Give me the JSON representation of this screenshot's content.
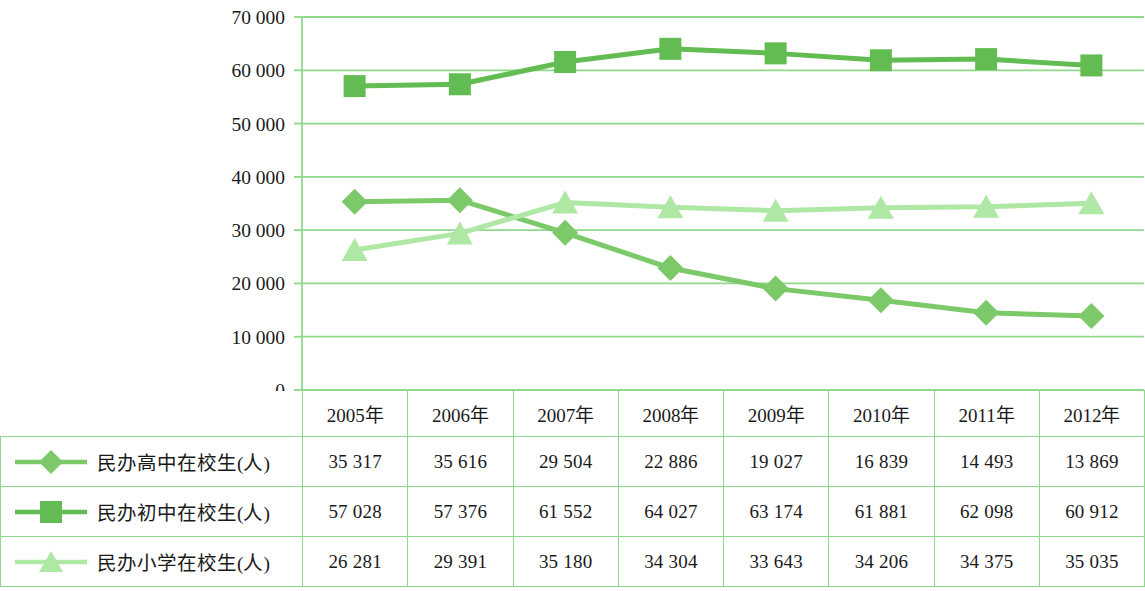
{
  "chart_data": {
    "type": "line",
    "title": "",
    "xlabel": "",
    "ylabel": "",
    "categories": [
      "2005年",
      "2006年",
      "2007年",
      "2008年",
      "2009年",
      "2010年",
      "2011年",
      "2012年"
    ],
    "ylim": [
      0,
      70000
    ],
    "yticks": [
      0,
      10000,
      20000,
      30000,
      40000,
      50000,
      60000,
      70000
    ],
    "ytick_labels": [
      "0",
      "10 000",
      "20 000",
      "30 000",
      "40 000",
      "50 000",
      "60 000",
      "70 000"
    ],
    "grid": true,
    "legend_position": "table-left",
    "series": [
      {
        "name": "民办高中在校生(人)",
        "marker": "diamond",
        "color": "#7cc96a",
        "values": [
          35317,
          35616,
          29504,
          22886,
          19027,
          16839,
          14493,
          13869
        ],
        "labels": [
          "35 317",
          "35 616",
          "29 504",
          "22 886",
          "19 027",
          "16 839",
          "14 493",
          "13 869"
        ]
      },
      {
        "name": "民办初中在校生(人)",
        "marker": "square",
        "color": "#63bc52",
        "values": [
          57028,
          57376,
          61552,
          64027,
          63174,
          61881,
          62098,
          60912
        ],
        "labels": [
          "57 028",
          "57 376",
          "61 552",
          "64 027",
          "63 174",
          "61 881",
          "62 098",
          "60 912"
        ]
      },
      {
        "name": "民办小学在校生(人)",
        "marker": "triangle",
        "color": "#aee8a4",
        "values": [
          26281,
          29391,
          35180,
          34304,
          33643,
          34206,
          34375,
          35035
        ],
        "labels": [
          "26 281",
          "29 391",
          "35 180",
          "34 304",
          "33 643",
          "34 206",
          "34 375",
          "35 035"
        ]
      }
    ]
  },
  "table": {
    "corner_label": "",
    "headers": [
      "2005年",
      "2006年",
      "2007年",
      "2008年",
      "2009年",
      "2010年",
      "2011年",
      "2012年"
    ],
    "rows": [
      {
        "label": "民办高中在校生(人)",
        "values": [
          "35 317",
          "35 616",
          "29 504",
          "22 886",
          "19 027",
          "16 839",
          "14 493",
          "13 869"
        ]
      },
      {
        "label": "民办初中在校生(人)",
        "values": [
          "57 028",
          "57 376",
          "61 552",
          "64 027",
          "63 174",
          "61 881",
          "62 098",
          "60 912"
        ]
      },
      {
        "label": "民办小学在校生(人)",
        "values": [
          "26 281",
          "29 391",
          "35 180",
          "34 304",
          "33 643",
          "34 206",
          "34 375",
          "35 035"
        ]
      }
    ]
  },
  "colors": {
    "grid": "#8fd98a",
    "series_high_school": "#7cc96a",
    "series_middle_school": "#63bc52",
    "series_primary_school": "#aee8a4",
    "text": "#1a1a1a"
  }
}
